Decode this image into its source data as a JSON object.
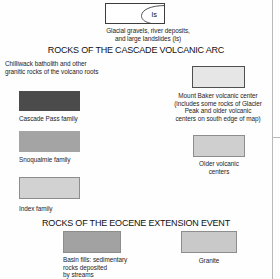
{
  "legend": {
    "surficial": {
      "swatch_name": "surficial-deposits-swatch",
      "inset_label": "ls",
      "caption_line1": "Glacial gravels, river deposits,",
      "caption_line2": "and large landslides (ls)",
      "fill": "#ffffff",
      "border": "#3d3d3d"
    },
    "sections": [
      {
        "id": "cascade-volcanic-arc",
        "title": "ROCKS OF THE CASCADE VOLCANIC ARC"
      },
      {
        "id": "eocene-extension-event",
        "title": "ROCKS OF THE EOCENE EXTENSION EVENT"
      }
    ],
    "intro_text": {
      "line1": "Chilliwack batholith and other",
      "line2": "granitic rocks of the volcano roots"
    },
    "entries": [
      {
        "id": "cascade-pass-family",
        "label": "Cascade Pass family",
        "color": "#4b4b4b",
        "bordered": false
      },
      {
        "id": "snoqualmie-family",
        "label": "Snoqualmie family",
        "color": "#a4a4a4",
        "bordered": false
      },
      {
        "id": "index-family",
        "label": "Index family",
        "color": "#d2d2d2",
        "bordered": true
      },
      {
        "id": "mount-baker-volcanic-center",
        "label_line1": "Mount Baker volcanic center",
        "label_line2": "(includes some rocks of Glacier",
        "label_line3": "Peak and older volcanic",
        "label_line4": "centers on south edge of map)",
        "color": "#e6e6e6",
        "bordered": true
      },
      {
        "id": "older-volcanic-centers",
        "label_line1": "Older volcanic",
        "label_line2": "centers",
        "color": "#cfcfcf",
        "bordered": true
      },
      {
        "id": "basin-fills",
        "label_line1": "Basin fills: sedimentary",
        "label_line2": "rocks deposited",
        "label_line3": "by streams",
        "color": "#a2a2a2",
        "bordered": true
      },
      {
        "id": "granite",
        "label": "Granite",
        "color": "#c9c9c9",
        "bordered": true
      }
    ]
  }
}
